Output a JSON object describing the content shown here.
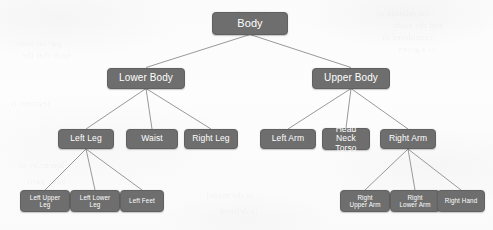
{
  "diagram": {
    "type": "tree",
    "node_fill_color": "#6e6e6e",
    "node_text_color": "#ffffff",
    "edge_color": "#8d8d8d",
    "background_color": "#fcfcfc",
    "levels": 4,
    "nodes": [
      {
        "id": "body",
        "label": "Body",
        "level": 1,
        "parent": null,
        "x": 250,
        "y": 23,
        "w": 76,
        "h": 23
      },
      {
        "id": "lower-body",
        "label": "Lower Body",
        "level": 2,
        "parent": "body",
        "x": 146,
        "y": 78,
        "w": 78,
        "h": 21
      },
      {
        "id": "upper-body",
        "label": "Upper Body",
        "level": 2,
        "parent": "body",
        "x": 351,
        "y": 78,
        "w": 78,
        "h": 21
      },
      {
        "id": "left-leg",
        "label": "Left Leg",
        "level": 3,
        "parent": "lower-body",
        "x": 86,
        "y": 139,
        "w": 56,
        "h": 20
      },
      {
        "id": "waist",
        "label": "Waist",
        "level": 3,
        "parent": "lower-body",
        "x": 152,
        "y": 139,
        "w": 52,
        "h": 20
      },
      {
        "id": "right-leg",
        "label": "Right Leg",
        "level": 3,
        "parent": "lower-body",
        "x": 211,
        "y": 139,
        "w": 54,
        "h": 20
      },
      {
        "id": "left-arm",
        "label": "Left Arm",
        "level": 3,
        "parent": "upper-body",
        "x": 288,
        "y": 139,
        "w": 56,
        "h": 20
      },
      {
        "id": "head-neck-torso",
        "label": "Head Neck\nTorso",
        "level": 3,
        "parent": "upper-body",
        "x": 346,
        "y": 139,
        "w": 48,
        "h": 22
      },
      {
        "id": "right-arm",
        "label": "Right Arm",
        "level": 3,
        "parent": "upper-body",
        "x": 408,
        "y": 139,
        "w": 56,
        "h": 20
      },
      {
        "id": "left-upper-leg",
        "label": "Left Upper\nLeg",
        "level": 4,
        "parent": "left-leg",
        "x": 45,
        "y": 201,
        "w": 50,
        "h": 22
      },
      {
        "id": "left-lower-leg",
        "label": "Left Lower\nLeg",
        "level": 4,
        "parent": "left-leg",
        "x": 95,
        "y": 201,
        "w": 50,
        "h": 22
      },
      {
        "id": "left-feet",
        "label": "Left Feet",
        "level": 4,
        "parent": "left-leg",
        "x": 142,
        "y": 201,
        "w": 44,
        "h": 22
      },
      {
        "id": "right-upper-arm",
        "label": "Right\nUpper Arm",
        "level": 4,
        "parent": "right-arm",
        "x": 365,
        "y": 201,
        "w": 50,
        "h": 22
      },
      {
        "id": "right-lower-arm",
        "label": "Right\nLower Arm",
        "level": 4,
        "parent": "right-arm",
        "x": 415,
        "y": 201,
        "w": 50,
        "h": 22
      },
      {
        "id": "right-hand",
        "label": "Right Hand",
        "level": 4,
        "parent": "right-arm",
        "x": 461,
        "y": 201,
        "w": 48,
        "h": 22
      }
    ],
    "edges": [
      {
        "from": "body",
        "to": "lower-body"
      },
      {
        "from": "body",
        "to": "upper-body"
      },
      {
        "from": "lower-body",
        "to": "left-leg"
      },
      {
        "from": "lower-body",
        "to": "waist"
      },
      {
        "from": "lower-body",
        "to": "right-leg"
      },
      {
        "from": "upper-body",
        "to": "left-arm"
      },
      {
        "from": "upper-body",
        "to": "head-neck-torso"
      },
      {
        "from": "upper-body",
        "to": "right-arm"
      },
      {
        "from": "left-leg",
        "to": "left-upper-leg"
      },
      {
        "from": "left-leg",
        "to": "left-lower-leg"
      },
      {
        "from": "left-leg",
        "to": "left-feet"
      },
      {
        "from": "right-arm",
        "to": "right-upper-arm"
      },
      {
        "from": "right-arm",
        "to": "right-lower-arm"
      },
      {
        "from": "right-arm",
        "to": "right-hand"
      }
    ]
  },
  "background_artifacts": [
    {
      "text": "the relation of",
      "x": 376,
      "y": 8
    },
    {
      "text": "and the study",
      "x": 392,
      "y": 20
    },
    {
      "text": "considered in",
      "x": 382,
      "y": 32
    },
    {
      "text": "of a given",
      "x": 398,
      "y": 44
    },
    {
      "text": "partial order",
      "x": 14,
      "y": 38
    },
    {
      "text": "such that the",
      "x": 22,
      "y": 50
    },
    {
      "text": "segment is",
      "x": 10,
      "y": 98
    },
    {
      "text": "hierarchy of",
      "x": 18,
      "y": 160
    },
    {
      "text": "body parts",
      "x": 26,
      "y": 176
    },
    {
      "text": "in the model",
      "x": 206,
      "y": 190
    },
    {
      "text": "is defined",
      "x": 220,
      "y": 206
    },
    {
      "text": "structure",
      "x": 236,
      "y": 6
    }
  ]
}
